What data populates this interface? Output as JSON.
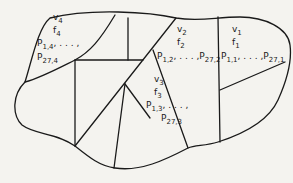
{
  "diagram": {
    "stroke_color": "#1a1a1a",
    "background": "#f4f3ef",
    "regions": [
      {
        "id": "1",
        "v": "v",
        "v_sub": "1",
        "f": "f",
        "f_sub": "1",
        "p_first": "P",
        "p_first_sub": "1,1",
        "ellipsis": ", . . . ,",
        "p_last": "P",
        "p_last_sub": "27,1"
      },
      {
        "id": "2",
        "v": "v",
        "v_sub": "2",
        "f": "f",
        "f_sub": "2",
        "p_first": "P",
        "p_first_sub": "1,2",
        "ellipsis": ", . . . ,",
        "p_last": "P",
        "p_last_sub": "27,2"
      },
      {
        "id": "3",
        "v": "v",
        "v_sub": "3",
        "f": "f",
        "f_sub": "3",
        "p_first": "P",
        "p_first_sub": "1,3",
        "ellipsis": ", . . . ,",
        "p_last": "P",
        "p_last_sub": "27,3"
      },
      {
        "id": "4",
        "v": "v",
        "v_sub": "4",
        "f": "f",
        "f_sub": "4",
        "p_first": "P",
        "p_first_sub": "1,4",
        "ellipsis": ", . . . ,",
        "p_last": "P",
        "p_last_sub": "27,4"
      }
    ]
  }
}
